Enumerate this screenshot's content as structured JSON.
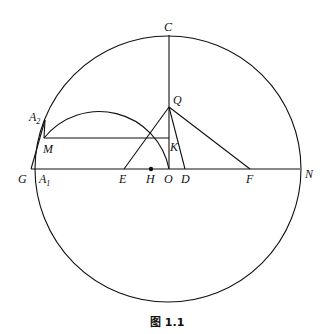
{
  "caption": "图 1.1",
  "labels": {
    "C": "C",
    "Q": "Q",
    "A2": "A",
    "A2_sub": "2",
    "M": "M",
    "K": "K",
    "G": "G",
    "A1": "A",
    "A1_sub": "1",
    "E": "E",
    "H": "H",
    "O": "O",
    "D": "D",
    "F": "F",
    "N": "N"
  },
  "colors": {
    "stroke": "#111111",
    "background": "#ffffff"
  }
}
